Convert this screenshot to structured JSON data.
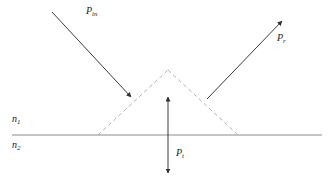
{
  "figure": {
    "background_color": "#ffffff",
    "width": 332,
    "height": 188
  },
  "labels": {
    "incident_power": {
      "symbol": "P",
      "subscript": "in",
      "text": "P_in"
    },
    "reflected_power": {
      "symbol": "P",
      "subscript": "r",
      "text": "P_r"
    },
    "transmitted_power": {
      "symbol": "P",
      "subscript": "t",
      "text": "P_t"
    },
    "medium_upper": {
      "symbol": "n",
      "subscript": "1",
      "text": "n_1"
    },
    "medium_lower": {
      "symbol": "n",
      "subscript": "2",
      "text": "n_2"
    }
  },
  "colors": {
    "ray_stroke": "#3a3a3a",
    "interface_stroke": "#8a8a8a",
    "dashed_stroke": "#b0b0b0",
    "text": "#222222"
  },
  "geometry": {
    "interface_line": {
      "x1": 12,
      "y1": 135,
      "x2": 322,
      "y2": 135
    },
    "incident_ray": {
      "x1": 52,
      "y1": 12,
      "x2": 133,
      "y2": 99,
      "arrow": "end"
    },
    "reflected_ray": {
      "x1": 207,
      "y1": 99,
      "x2": 284,
      "y2": 19,
      "arrow": "end"
    },
    "transmitted_ray": {
      "x": 168,
      "y1": 95,
      "y2": 175,
      "arrow": "both"
    },
    "dashed_triangle": {
      "left_base": {
        "x": 98,
        "y": 135
      },
      "apex": {
        "x": 168,
        "y": 70
      },
      "right_base": {
        "x": 238,
        "y": 135
      }
    }
  }
}
